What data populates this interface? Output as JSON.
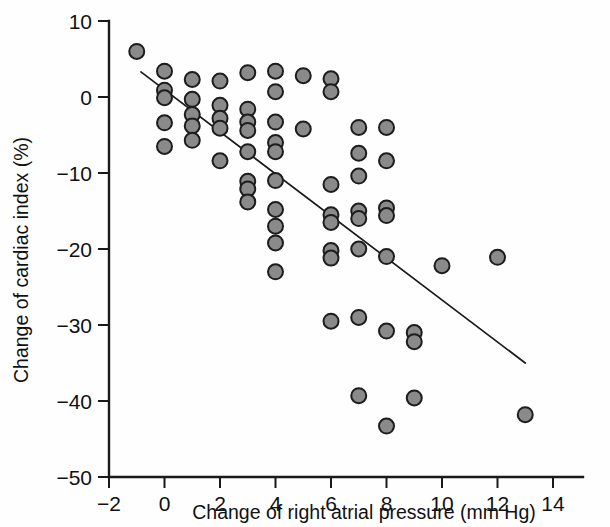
{
  "chart_data": {
    "type": "scatter",
    "title": "",
    "xlabel": "Change of right atrial pressure (mm Hg)",
    "ylabel": "Change of cardiac index (%)",
    "xlim": [
      -2,
      15
    ],
    "ylim": [
      -50,
      10
    ],
    "xticks": [
      -2,
      0,
      2,
      4,
      6,
      8,
      10,
      12,
      14
    ],
    "xticklabels": [
      "−2",
      "0",
      "2",
      "4",
      "6",
      "8",
      "10",
      "12",
      "14"
    ],
    "yticks": [
      10,
      0,
      -10,
      -20,
      -30,
      -40,
      -50
    ],
    "yticklabels": [
      "10",
      "0",
      "−10",
      "−20",
      "−30",
      "−40",
      "−50"
    ],
    "grid": false,
    "legend": null,
    "marker": {
      "shape": "circle",
      "fill_color": "#8a8a8a",
      "edge_color": "#1c1c1c",
      "radius_px": 7.5
    },
    "points": [
      {
        "x": -1,
        "y": 6.0
      },
      {
        "x": 0,
        "y": 3.4
      },
      {
        "x": 0,
        "y": 0.9
      },
      {
        "x": 0,
        "y": -0.1
      },
      {
        "x": 0,
        "y": -3.4
      },
      {
        "x": 0,
        "y": -6.5
      },
      {
        "x": 1,
        "y": 2.3
      },
      {
        "x": 1,
        "y": -0.3
      },
      {
        "x": 1,
        "y": -2.3
      },
      {
        "x": 1,
        "y": -3.8
      },
      {
        "x": 1,
        "y": -5.7
      },
      {
        "x": 2,
        "y": 2.1
      },
      {
        "x": 2,
        "y": -1.1
      },
      {
        "x": 2,
        "y": -2.8
      },
      {
        "x": 2,
        "y": -4.1
      },
      {
        "x": 2,
        "y": -8.4
      },
      {
        "x": 3,
        "y": 3.2
      },
      {
        "x": 3,
        "y": -1.6
      },
      {
        "x": 3,
        "y": -3.3
      },
      {
        "x": 3,
        "y": -4.4
      },
      {
        "x": 3,
        "y": -7.2
      },
      {
        "x": 3,
        "y": -11.1
      },
      {
        "x": 3,
        "y": -12.1
      },
      {
        "x": 3,
        "y": -13.8
      },
      {
        "x": 4,
        "y": 3.4
      },
      {
        "x": 4,
        "y": 0.7
      },
      {
        "x": 4,
        "y": -3.3
      },
      {
        "x": 4,
        "y": -6.0
      },
      {
        "x": 4,
        "y": -7.2
      },
      {
        "x": 4,
        "y": -11.0
      },
      {
        "x": 4,
        "y": -14.8
      },
      {
        "x": 4,
        "y": -17.0
      },
      {
        "x": 4,
        "y": -19.2
      },
      {
        "x": 4,
        "y": -23.0
      },
      {
        "x": 5,
        "y": 2.8
      },
      {
        "x": 5,
        "y": -4.2
      },
      {
        "x": 6,
        "y": 2.4
      },
      {
        "x": 6,
        "y": 0.7
      },
      {
        "x": 6,
        "y": -11.5
      },
      {
        "x": 6,
        "y": -15.5
      },
      {
        "x": 6,
        "y": -16.5
      },
      {
        "x": 6,
        "y": -20.2
      },
      {
        "x": 6,
        "y": -21.2
      },
      {
        "x": 6,
        "y": -29.5
      },
      {
        "x": 7,
        "y": -4.0
      },
      {
        "x": 7,
        "y": -7.4
      },
      {
        "x": 7,
        "y": -10.4
      },
      {
        "x": 7,
        "y": -15.0
      },
      {
        "x": 7,
        "y": -16.0
      },
      {
        "x": 7,
        "y": -20.0
      },
      {
        "x": 7,
        "y": -29.0
      },
      {
        "x": 7,
        "y": -39.3
      },
      {
        "x": 8,
        "y": -4.0
      },
      {
        "x": 8,
        "y": -8.4
      },
      {
        "x": 8,
        "y": -14.6
      },
      {
        "x": 8,
        "y": -15.6
      },
      {
        "x": 8,
        "y": -21.0
      },
      {
        "x": 8,
        "y": -30.8
      },
      {
        "x": 8,
        "y": -43.3
      },
      {
        "x": 9,
        "y": -31.0
      },
      {
        "x": 9,
        "y": -32.2
      },
      {
        "x": 9,
        "y": -39.6
      },
      {
        "x": 10,
        "y": -22.2
      },
      {
        "x": 12,
        "y": -21.1
      },
      {
        "x": 13,
        "y": -41.8
      }
    ],
    "fit_line": {
      "type": "linear_regression",
      "x_start": -0.85,
      "y_start": 3.3,
      "x_end": 13.0,
      "y_end": -35.0
    }
  }
}
